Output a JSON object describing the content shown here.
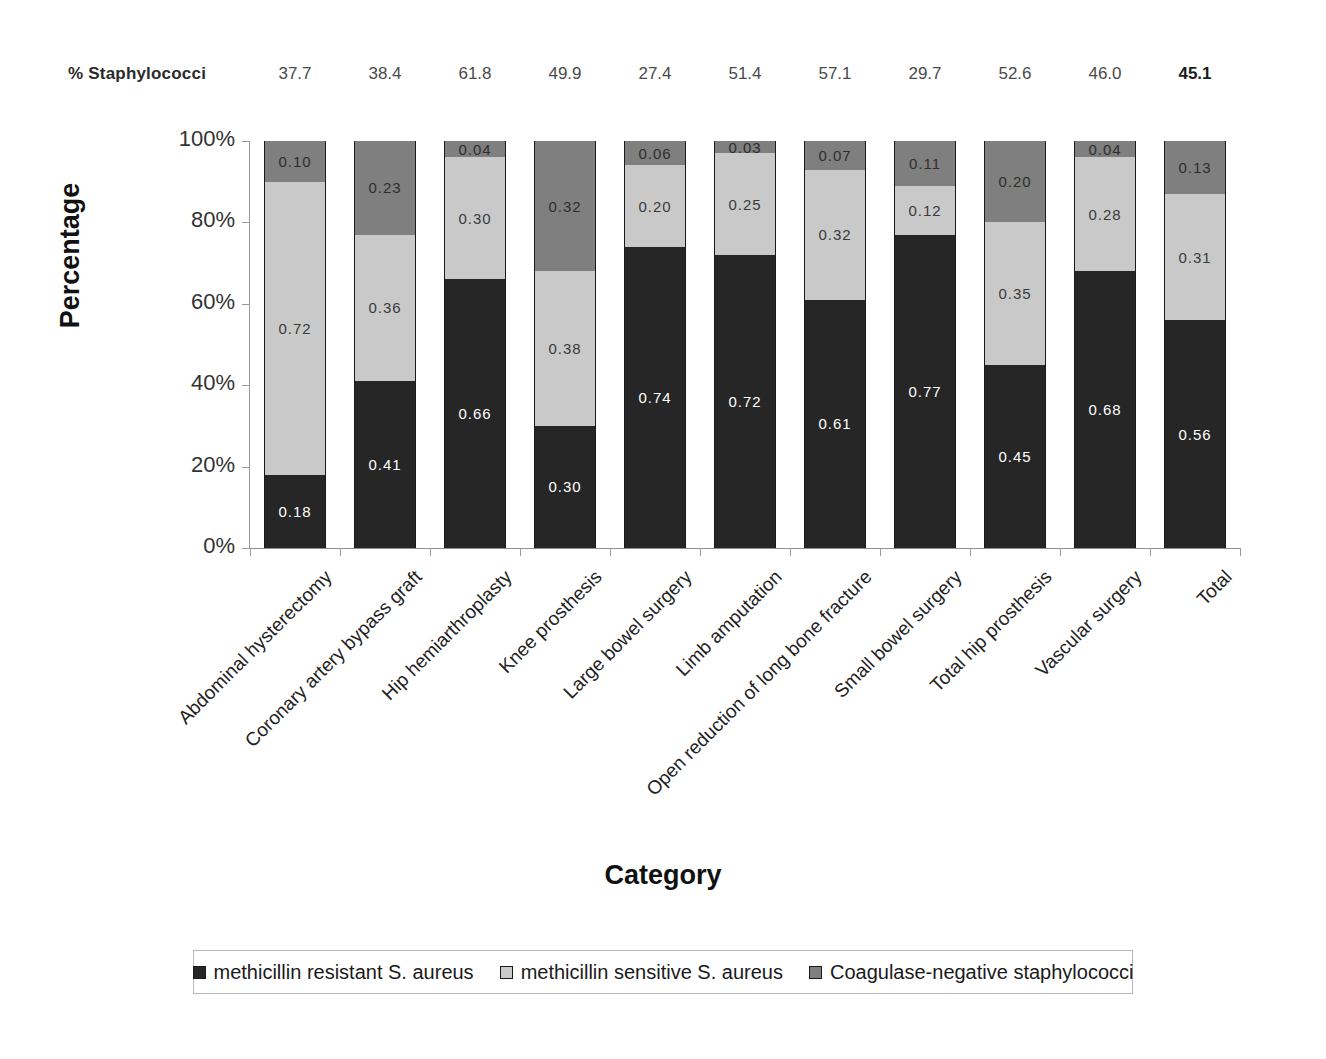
{
  "header": {
    "label": "% Staphylococci",
    "values": [
      "37.7",
      "38.4",
      "61.8",
      "49.9",
      "27.4",
      "51.4",
      "57.1",
      "29.7",
      "52.6",
      "46.0",
      "45.1"
    ],
    "bold_last": true
  },
  "axis_titles": {
    "y": "Percentage",
    "x": "Category"
  },
  "y_ticks": [
    "100%",
    "80%",
    "60%",
    "40%",
    "20%",
    "0%"
  ],
  "legend": {
    "items": [
      {
        "label": "methicillin resistant S. aureus",
        "color": "#262626"
      },
      {
        "label": "methicillin sensitive S. aureus",
        "color": "#c9c9c9"
      },
      {
        "label": "Coagulase-negative staphylococci",
        "color": "#7f7f7f"
      }
    ]
  },
  "chart_data": {
    "type": "bar",
    "subtype": "stacked-100-percent",
    "title": "",
    "xlabel": "Category",
    "ylabel": "Percentage",
    "ylim": [
      0,
      100
    ],
    "y_tick_values": [
      0,
      20,
      40,
      60,
      80,
      100
    ],
    "grid": false,
    "legend_position": "bottom",
    "categories": [
      "Abdominal hysterectomy",
      "Coronary artery bypass graft",
      "Hip hemiarthroplasty",
      "Knee prosthesis",
      "Large bowel surgery",
      "Limb amputation",
      "Open reduction of long bone fracture",
      "Small bowel surgery",
      "Total hip prosthesis",
      "Vascular surgery",
      "Total"
    ],
    "series": [
      {
        "name": "methicillin resistant S. aureus",
        "color": "#262626",
        "values": [
          0.18,
          0.41,
          0.66,
          0.3,
          0.74,
          0.72,
          0.61,
          0.77,
          0.45,
          0.68,
          0.56
        ],
        "labels": [
          "0.18",
          "0.41",
          "0.66",
          "0.30",
          "0.74",
          "0.72",
          "0.61",
          "0.77",
          "0.45",
          "0.68",
          "0.56"
        ]
      },
      {
        "name": "methicillin sensitive S. aureus",
        "color": "#c9c9c9",
        "values": [
          0.72,
          0.36,
          0.3,
          0.38,
          0.2,
          0.25,
          0.32,
          0.12,
          0.35,
          0.28,
          0.31
        ],
        "labels": [
          "0.72",
          "0.36",
          "0.30",
          "0.38",
          "0.20",
          "0.25",
          "0.32",
          "0.12",
          "0.35",
          "0.28",
          "0.31"
        ]
      },
      {
        "name": "Coagulase-negative staphylococci",
        "color": "#7f7f7f",
        "values": [
          0.1,
          0.23,
          0.04,
          0.32,
          0.06,
          0.03,
          0.07,
          0.11,
          0.2,
          0.04,
          0.13
        ],
        "labels": [
          "0.10",
          "0.23",
          "0.04",
          "0.32",
          "0.06",
          "0.03",
          "0.07",
          "0.11",
          "0.20",
          "0.04",
          "0.13"
        ]
      }
    ],
    "annotations": {
      "row_label": "% Staphylococci",
      "row_values": [
        37.7,
        38.4,
        61.8,
        49.9,
        27.4,
        51.4,
        57.1,
        29.7,
        52.6,
        46.0,
        45.1
      ]
    }
  }
}
